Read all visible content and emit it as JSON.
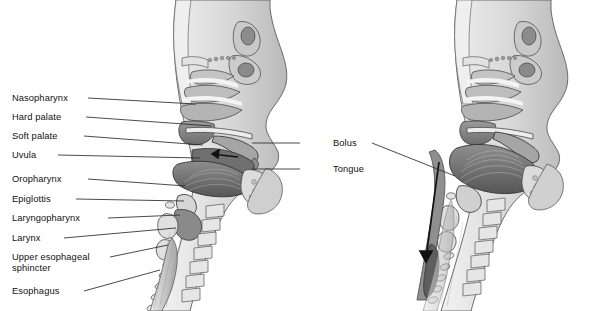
{
  "figure": {
    "type": "anatomical-illustration",
    "style": "grayscale-medical-line-art",
    "background_color": "#ffffff",
    "text_color": "#111111",
    "leader_line_color": "#2a2a2a",
    "panels": [
      {
        "id": "left",
        "name": "oral-preparatory-phase",
        "description": "Sagittal view of head and neck; bolus held in the oral cavity with arrow pointing posteriorly"
      },
      {
        "id": "right",
        "name": "pharyngeal-esophageal-phase",
        "description": "Sagittal view of head and neck; bolus descending through the pharynx into the esophagus, long downward arrow"
      }
    ]
  },
  "labels_left": [
    {
      "id": "nasopharynx",
      "text": "Nasopharynx",
      "x": 12,
      "y": 93,
      "line": {
        "x1": 88,
        "y1": 98,
        "x2": 196,
        "y2": 104
      }
    },
    {
      "id": "hard-palate",
      "text": "Hard palate",
      "x": 12,
      "y": 112,
      "line": {
        "x1": 86,
        "y1": 117,
        "x2": 212,
        "y2": 126
      }
    },
    {
      "id": "soft-palate",
      "text": "Soft palate",
      "x": 12,
      "y": 131,
      "line": {
        "x1": 84,
        "y1": 136,
        "x2": 203,
        "y2": 145
      }
    },
    {
      "id": "uvula",
      "text": "Uvula",
      "x": 12,
      "y": 150,
      "line": {
        "x1": 58,
        "y1": 155,
        "x2": 200,
        "y2": 158
      }
    },
    {
      "id": "oropharynx",
      "text": "Oropharynx",
      "x": 12,
      "y": 174,
      "line": {
        "x1": 88,
        "y1": 179,
        "x2": 186,
        "y2": 186
      }
    },
    {
      "id": "epiglottis",
      "text": "Epiglottis",
      "x": 12,
      "y": 194,
      "line": {
        "x1": 76,
        "y1": 199,
        "x2": 184,
        "y2": 201
      }
    },
    {
      "id": "laryngopharynx",
      "text": "Laryngopharynx",
      "x": 12,
      "y": 213,
      "line": {
        "x1": 108,
        "y1": 218,
        "x2": 180,
        "y2": 215
      }
    },
    {
      "id": "larynx",
      "text": "Larynx",
      "x": 12,
      "y": 233,
      "line": {
        "x1": 64,
        "y1": 238,
        "x2": 176,
        "y2": 228
      }
    },
    {
      "id": "upper-esophageal-sphincter",
      "text": "Upper esophageal\nsphincter",
      "x": 12,
      "y": 252,
      "line": {
        "x1": 110,
        "y1": 257,
        "x2": 168,
        "y2": 245
      }
    },
    {
      "id": "esophagus",
      "text": "Esophagus",
      "x": 12,
      "y": 286,
      "line": {
        "x1": 84,
        "y1": 291,
        "x2": 160,
        "y2": 270
      }
    }
  ],
  "labels_right": [
    {
      "id": "bolus",
      "text": "Bolus",
      "x": 333,
      "y": 138,
      "line_left": {
        "x1": 300,
        "y1": 143,
        "x2": 252,
        "y2": 143
      },
      "line_right": {
        "x1": 372,
        "y1": 143,
        "x2": 455,
        "y2": 176
      }
    },
    {
      "id": "tongue",
      "text": "Tongue",
      "x": 333,
      "y": 164,
      "line_left": {
        "x1": 300,
        "y1": 169,
        "x2": 252,
        "y2": 169
      }
    }
  ]
}
